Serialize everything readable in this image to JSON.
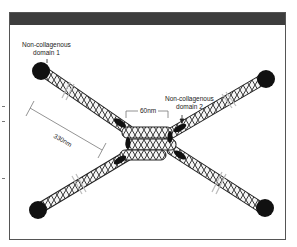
{
  "diagram": {
    "labels": {
      "ncd1_line1": "Non-collagenous",
      "ncd1_line2": "domain 1",
      "ncd2_line1": "Non-collagenous",
      "ncd2_line2": "domain 2",
      "dim_60": "60nm",
      "dim_330": "330nm"
    },
    "colors": {
      "frame_border": "#555555",
      "header_bar": "#3d3d3d",
      "globular_domain": "#111111",
      "helix_stroke": "#222222",
      "background": "#ffffff"
    }
  }
}
